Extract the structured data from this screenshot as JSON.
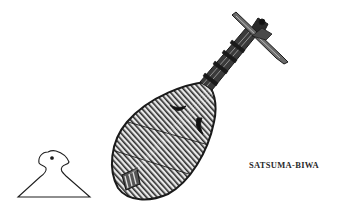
{
  "caption": "SATSUMA-BIWA",
  "illustration": {
    "subject": "satsuma-biwa lute",
    "secondary_subject": "bachi plectrum",
    "ink_color": "#1e1e1e",
    "paper_color": "#ffffff"
  }
}
